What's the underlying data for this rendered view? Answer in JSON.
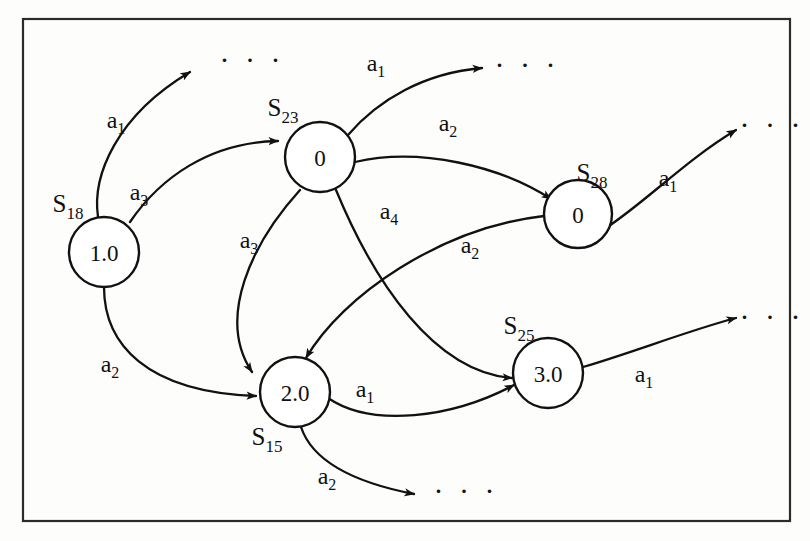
{
  "figure": {
    "background_color": "#fdfdfc",
    "frame_color": "#2b2b2b",
    "stroke_color": "#111111",
    "node_fill": "#ffffff"
  },
  "nodes": [
    {
      "id": "S18",
      "name_base": "S",
      "name_sub": "18",
      "value": "1.0",
      "cx": 104,
      "cy": 252,
      "r": 35,
      "label_x": 68,
      "label_y": 212
    },
    {
      "id": "S23",
      "name_base": "S",
      "name_sub": "23",
      "value": "0",
      "cx": 320,
      "cy": 157,
      "r": 35,
      "label_x": 283,
      "label_y": 116
    },
    {
      "id": "S28",
      "name_base": "S",
      "name_sub": "28",
      "value": "0",
      "cx": 578,
      "cy": 214,
      "r": 34,
      "label_x": 592,
      "label_y": 181
    },
    {
      "id": "S15",
      "name_base": "S",
      "name_sub": "15",
      "value": "2.0",
      "cx": 295,
      "cy": 392,
      "r": 35,
      "label_x": 267,
      "label_y": 445
    },
    {
      "id": "S25",
      "name_base": "S",
      "name_sub": "25",
      "value": "3.0",
      "cx": 548,
      "cy": 373,
      "r": 35,
      "label_x": 519,
      "label_y": 334
    }
  ],
  "edges": [
    {
      "id": "e-s18-a1-out",
      "from": "S18",
      "to": "ellipsis-top-left",
      "action_base": "a",
      "action_sub": "1",
      "label_x": 116,
      "label_y": 128,
      "path": "M 98 217 C 92 176 116 116 190 72",
      "arrow": true
    },
    {
      "id": "e-s18-a3-s23",
      "from": "S18",
      "to": "S23",
      "action_base": "a",
      "action_sub": "3",
      "label_x": 139,
      "label_y": 200,
      "path": "M 130 222 C 160 178 210 142 278 141",
      "arrow": true
    },
    {
      "id": "e-s18-a2-s15",
      "from": "S18",
      "to": "S15",
      "action_base": "a",
      "action_sub": "2",
      "label_x": 110,
      "label_y": 372,
      "path": "M 104 287 C 104 344 146 392 256 396",
      "arrow": true
    },
    {
      "id": "e-s23-a1-out",
      "from": "S23",
      "to": "ellipsis-top-mid",
      "action_base": "a",
      "action_sub": "1",
      "label_x": 376,
      "label_y": 71,
      "path": "M 348 135 C 378 100 424 73 482 68",
      "arrow": true
    },
    {
      "id": "e-s23-a2-s28",
      "from": "S23",
      "to": "S28",
      "action_base": "a",
      "action_sub": "2",
      "label_x": 448,
      "label_y": 131,
      "path": "M 355 162 C 420 147 500 166 551 199",
      "arrow": true
    },
    {
      "id": "e-s23-a3-s15",
      "from": "S23",
      "to": "S15",
      "action_base": "a",
      "action_sub": "3",
      "label_x": 249,
      "label_y": 248,
      "path": "M 300 190 C 252 243 216 318 252 372",
      "arrow": true
    },
    {
      "id": "e-s23-a4-s25",
      "from": "S23",
      "to": "S25",
      "action_base": "a",
      "action_sub": "4",
      "label_x": 389,
      "label_y": 219,
      "path": "M 336 190 C 374 282 434 372 512 378",
      "arrow": true
    },
    {
      "id": "e-s28-a1-out",
      "from": "S28",
      "to": "ellipsis-top-right",
      "action_base": "a",
      "action_sub": "1",
      "label_x": 668,
      "label_y": 186,
      "path": "M 606 228 C 648 200 686 160 736 130",
      "arrow": true
    },
    {
      "id": "e-s28-a2-s15",
      "from": "S28",
      "to": "S15",
      "action_base": "a",
      "action_sub": "2",
      "label_x": 470,
      "label_y": 253,
      "path": "M 544 216 C 440 228 342 296 306 358",
      "arrow": true
    },
    {
      "id": "e-s15-a1-s25",
      "from": "S15",
      "to": "S25",
      "action_base": "a",
      "action_sub": "1",
      "label_x": 365,
      "label_y": 397,
      "path": "M 328 398 C 372 428 452 418 514 385",
      "arrow": true
    },
    {
      "id": "e-s15-a2-out",
      "from": "S15",
      "to": "ellipsis-bottom",
      "action_base": "a",
      "action_sub": "2",
      "label_x": 327,
      "label_y": 484,
      "path": "M 301 427 C 312 460 352 482 414 494",
      "arrow": true
    },
    {
      "id": "e-s25-a1-out",
      "from": "S25",
      "to": "ellipsis-right",
      "action_base": "a",
      "action_sub": "1",
      "label_x": 644,
      "label_y": 382,
      "path": "M 583 367 C 634 352 690 330 736 318",
      "arrow": true
    }
  ],
  "ellipses": [
    {
      "id": "ellipsis-top-left",
      "text": "· · ·",
      "x": 252,
      "y": 70
    },
    {
      "id": "ellipsis-top-mid",
      "text": "· · ·",
      "x": 527,
      "y": 75
    },
    {
      "id": "ellipsis-top-right",
      "text": "· · ·",
      "x": 772,
      "y": 135
    },
    {
      "id": "ellipsis-right",
      "text": "· · ·",
      "x": 772,
      "y": 327
    },
    {
      "id": "ellipsis-bottom",
      "text": "· · ·",
      "x": 466,
      "y": 501
    }
  ],
  "frame": {
    "x": 23,
    "y": 19,
    "width": 767,
    "height": 502
  }
}
